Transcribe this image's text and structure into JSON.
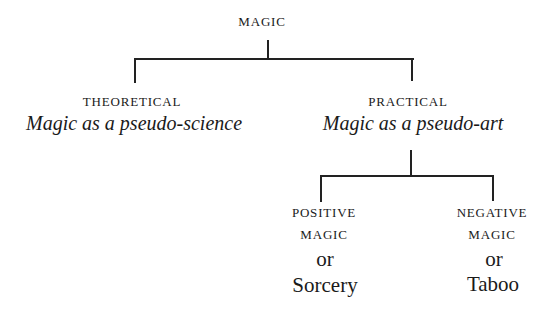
{
  "diagram": {
    "type": "tree",
    "root": {
      "label": "MAGIC"
    },
    "branches": [
      {
        "label": "THEORETICAL",
        "subtitle": "Magic as a pseudo-science"
      },
      {
        "label": "PRACTICAL",
        "subtitle": "Magic as a pseudo-art",
        "children": [
          {
            "line1": "POSITIVE",
            "line2": "MAGIC",
            "connector": "or",
            "alt": "Sorcery"
          },
          {
            "line1": "NEGATIVE",
            "line2": "MAGIC",
            "connector": "or",
            "alt": "Taboo"
          }
        ]
      }
    ],
    "colors": {
      "ink": "#1a1a1a",
      "line": "#222222",
      "background": "#ffffff"
    }
  }
}
